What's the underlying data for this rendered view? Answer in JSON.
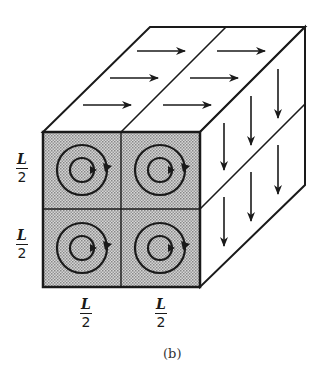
{
  "figure": {
    "caption": "(b)",
    "colors": {
      "stroke": "#1a1a1a",
      "front_fill": "#b8b8b8",
      "background": "#ffffff"
    },
    "labels": {
      "left_top": {
        "num": "L",
        "den": "2"
      },
      "left_bottom": {
        "num": "L",
        "den": "2"
      },
      "bottom_left": {
        "num": "L",
        "den": "2"
      },
      "bottom_right": {
        "num": "L",
        "den": "2"
      }
    },
    "faces": {
      "top": {
        "cells": 2,
        "arrow_direction": "right",
        "arrows_per_cell": 3
      },
      "right": {
        "cells": 2,
        "arrow_direction": "down",
        "arrows_per_cell": 3
      },
      "front": {
        "cells": 4,
        "grid": "2x2",
        "symbol": "concentric circles with clockwise circulation"
      }
    }
  }
}
